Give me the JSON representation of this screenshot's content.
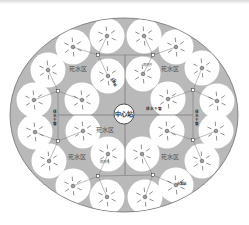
{
  "diagram": {
    "title": "",
    "colors": {
      "background": "#ffffff",
      "field": "#b9b9b9",
      "field_border": "#6e6e6e",
      "well_zone": "#ffffff",
      "pipe": "#7a7a7a",
      "text": "#555555",
      "dark_label": "#222222"
    },
    "center_station": {
      "label": "中心站",
      "x": 124,
      "y": 114,
      "r": 10
    },
    "dead_zone_labels": [
      {
        "label": "死水区",
        "x": 78,
        "y": 71
      },
      {
        "label": "死水区",
        "x": 170,
        "y": 71
      },
      {
        "label": "死水区",
        "x": 105,
        "y": 132
      },
      {
        "label": "死水区",
        "x": 77,
        "y": 159
      },
      {
        "label": "死水区",
        "x": 170,
        "y": 159
      }
    ],
    "small_labels": [
      {
        "label": "观测井",
        "x": 143,
        "y": 66,
        "size": 3.2
      },
      {
        "label": "观测井",
        "x": 100,
        "y": 163,
        "size": 3.2
      },
      {
        "label": "排水干管",
        "x": 146,
        "y": 110,
        "size": 3.6,
        "dark": true
      },
      {
        "label": "排水干管",
        "x": 54,
        "y": 118,
        "size": 3.6,
        "dark": true,
        "vertical": true
      },
      {
        "label": "排水干管",
        "x": 196,
        "y": 118,
        "size": 3.6,
        "dark": true,
        "vertical": true
      },
      {
        "label": "水泵站",
        "x": 110,
        "y": 79,
        "size": 3.4,
        "dark": true,
        "rotate": 55
      },
      {
        "label": "水泵站",
        "x": 177,
        "y": 185,
        "size": 3.4,
        "dark": true
      }
    ],
    "wells": [
      {
        "x": 73,
        "y": 47
      },
      {
        "x": 107,
        "y": 36
      },
      {
        "x": 144,
        "y": 36
      },
      {
        "x": 176,
        "y": 47
      },
      {
        "x": 48,
        "y": 70
      },
      {
        "x": 108,
        "y": 76
      },
      {
        "x": 143,
        "y": 74
      },
      {
        "x": 202,
        "y": 68
      },
      {
        "x": 34,
        "y": 100
      },
      {
        "x": 82,
        "y": 100
      },
      {
        "x": 168,
        "y": 99
      },
      {
        "x": 217,
        "y": 101
      },
      {
        "x": 35,
        "y": 132
      },
      {
        "x": 83,
        "y": 131
      },
      {
        "x": 167,
        "y": 131
      },
      {
        "x": 216,
        "y": 131
      },
      {
        "x": 49,
        "y": 161
      },
      {
        "x": 108,
        "y": 154
      },
      {
        "x": 142,
        "y": 154
      },
      {
        "x": 202,
        "y": 161
      },
      {
        "x": 73,
        "y": 186
      },
      {
        "x": 107,
        "y": 197
      },
      {
        "x": 145,
        "y": 197
      },
      {
        "x": 176,
        "y": 185
      }
    ],
    "network": {
      "junctions": [
        {
          "x": 98,
          "y": 55
        },
        {
          "x": 153,
          "y": 55
        },
        {
          "x": 58,
          "y": 91
        },
        {
          "x": 193,
          "y": 90
        },
        {
          "x": 58,
          "y": 141
        },
        {
          "x": 193,
          "y": 140
        },
        {
          "x": 98,
          "y": 176
        },
        {
          "x": 153,
          "y": 175
        }
      ]
    }
  }
}
